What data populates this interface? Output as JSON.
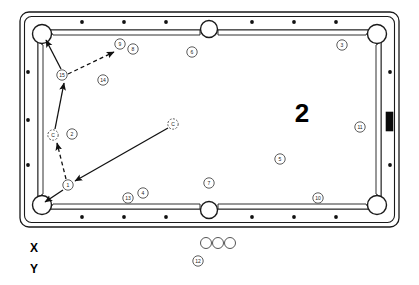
{
  "diagram": {
    "type": "pool-table-shot-diagram",
    "title_overlay": "2",
    "axis_labels": {
      "x": "X",
      "y": "Y"
    },
    "table": {
      "outer": {
        "x": 20,
        "y": 12,
        "width": 379,
        "height": 215,
        "corner_radius": 9
      },
      "playfield": {
        "x": 38,
        "y": 30,
        "width": 343,
        "height": 179
      },
      "rail_color": "#ffffff",
      "line_color": "#1a1a1a",
      "pockets": [
        {
          "name": "pocket-top-left",
          "cx": 42,
          "cy": 34,
          "r": 9.5
        },
        {
          "name": "pocket-top-middle",
          "cx": 209,
          "cy": 29,
          "r": 8.5
        },
        {
          "name": "pocket-top-right",
          "cx": 377,
          "cy": 34,
          "r": 9.5
        },
        {
          "name": "pocket-bottom-left",
          "cx": 42,
          "cy": 205,
          "r": 9.5
        },
        {
          "name": "pocket-bottom-middle",
          "cx": 209,
          "cy": 210,
          "r": 8.5
        },
        {
          "name": "pocket-bottom-right",
          "cx": 377,
          "cy": 205,
          "r": 9.5
        }
      ],
      "diamonds_top": [
        {
          "cx": 82,
          "cy": 22
        },
        {
          "cx": 124,
          "cy": 22
        },
        {
          "cx": 166,
          "cy": 22
        },
        {
          "cx": 252,
          "cy": 22
        },
        {
          "cx": 294,
          "cy": 22
        },
        {
          "cx": 336,
          "cy": 22
        }
      ],
      "diamonds_bottom": [
        {
          "cx": 82,
          "cy": 217
        },
        {
          "cx": 124,
          "cy": 217
        },
        {
          "cx": 166,
          "cy": 217
        },
        {
          "cx": 252,
          "cy": 217
        },
        {
          "cx": 294,
          "cy": 217
        },
        {
          "cx": 336,
          "cy": 217
        }
      ],
      "diamonds_left": [
        {
          "cx": 28,
          "cy": 72
        },
        {
          "cx": 28,
          "cy": 120
        },
        {
          "cx": 28,
          "cy": 165
        }
      ],
      "diamonds_right": [
        {
          "cx": 390,
          "cy": 72
        },
        {
          "cx": 390,
          "cy": 165
        }
      ],
      "rail_marker_bar": {
        "x": 386,
        "y": 112,
        "width": 7,
        "height": 19
      }
    },
    "balls": [
      {
        "label": "15",
        "cx": 62,
        "cy": 75,
        "r": 5.2,
        "kind": "numbered"
      },
      {
        "label": "9",
        "cx": 120,
        "cy": 44,
        "r": 5.2,
        "kind": "numbered"
      },
      {
        "label": "8",
        "cx": 133,
        "cy": 49,
        "r": 5.2,
        "kind": "numbered"
      },
      {
        "label": "14",
        "cx": 103,
        "cy": 80,
        "r": 5.2,
        "kind": "numbered"
      },
      {
        "label": "6",
        "cx": 192,
        "cy": 52,
        "r": 5.2,
        "kind": "numbered"
      },
      {
        "label": "3",
        "cx": 342,
        "cy": 45,
        "r": 5.2,
        "kind": "numbered"
      },
      {
        "label": "C",
        "cx": 53,
        "cy": 135,
        "r": 5.2,
        "kind": "cue"
      },
      {
        "label": "2",
        "cx": 72,
        "cy": 134,
        "r": 5.2,
        "kind": "numbered"
      },
      {
        "label": "C",
        "cx": 173,
        "cy": 124,
        "r": 5.2,
        "kind": "cue-target"
      },
      {
        "label": "11",
        "cx": 360,
        "cy": 127,
        "r": 5.2,
        "kind": "numbered"
      },
      {
        "label": "5",
        "cx": 280,
        "cy": 159,
        "r": 5.2,
        "kind": "numbered"
      },
      {
        "label": "7",
        "cx": 209,
        "cy": 183,
        "r": 5.2,
        "kind": "numbered"
      },
      {
        "label": "1",
        "cx": 68,
        "cy": 185,
        "r": 5.2,
        "kind": "numbered"
      },
      {
        "label": "13",
        "cx": 128,
        "cy": 198,
        "r": 5.2,
        "kind": "numbered"
      },
      {
        "label": "4",
        "cx": 143,
        "cy": 193,
        "r": 5.2,
        "kind": "numbered"
      },
      {
        "label": "10",
        "cx": 318,
        "cy": 198,
        "r": 5.2,
        "kind": "numbered"
      },
      {
        "label": "12",
        "cx": 198,
        "cy": 261,
        "r": 5.2,
        "kind": "numbered"
      }
    ],
    "off_table_balls": [
      {
        "name": "spare-ball-1",
        "cx": 206,
        "cy": 243,
        "r": 5.5
      },
      {
        "name": "spare-ball-2",
        "cx": 218,
        "cy": 243,
        "r": 5.5
      },
      {
        "name": "spare-ball-3",
        "cx": 230,
        "cy": 243,
        "r": 5.5
      }
    ],
    "shot_paths": [
      {
        "name": "shot-path-cue-incoming",
        "style": "solid",
        "from": {
          "x": 168,
          "y": 128
        },
        "to": {
          "x": 75,
          "y": 181
        },
        "arrow_at": "to"
      },
      {
        "name": "shot-path-one-to-cue",
        "style": "dashed",
        "from": {
          "x": 66,
          "y": 179
        },
        "to": {
          "x": 57,
          "y": 143
        },
        "arrow_at": "to"
      },
      {
        "name": "shot-path-one-to-corner",
        "style": "solid",
        "from": {
          "x": 63,
          "y": 190
        },
        "to": {
          "x": 45,
          "y": 202
        },
        "arrow_at": "to"
      },
      {
        "name": "shot-path-cue-to-fifteen",
        "style": "solid",
        "from": {
          "x": 55,
          "y": 129
        },
        "to": {
          "x": 64,
          "y": 83
        },
        "arrow_at": "to"
      },
      {
        "name": "shot-path-fifteen-to-pocket",
        "style": "solid",
        "from": {
          "x": 61,
          "y": 69
        },
        "to": {
          "x": 46,
          "y": 40
        },
        "arrow_at": "to"
      },
      {
        "name": "shot-path-fifteen-to-nine",
        "style": "dashed",
        "from": {
          "x": 68,
          "y": 74
        },
        "to": {
          "x": 114,
          "y": 52
        },
        "arrow_at": "to"
      }
    ]
  }
}
